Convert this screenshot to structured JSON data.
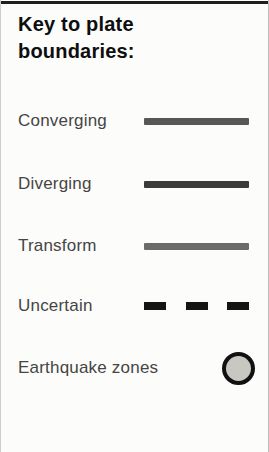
{
  "legend": {
    "title": "Key to plate boundaries:",
    "items": [
      {
        "label": "Converging",
        "symbol": "solid-line",
        "color": "#575757"
      },
      {
        "label": "Diverging",
        "symbol": "solid-line",
        "color": "#3b3b3b"
      },
      {
        "label": "Transform",
        "symbol": "solid-line",
        "color": "#6b6b6b"
      },
      {
        "label": "Uncertain",
        "symbol": "dashed-line",
        "color": "#141414"
      },
      {
        "label": "Earthquake zones",
        "symbol": "circle",
        "color": "#c8c7c2",
        "border_color": "#111111"
      }
    ],
    "panel_colors": {
      "background": "#fcfcfa",
      "top_rule": "#1e1e1e",
      "title_text": "#0e0e0e",
      "label_text": "#454545"
    }
  }
}
